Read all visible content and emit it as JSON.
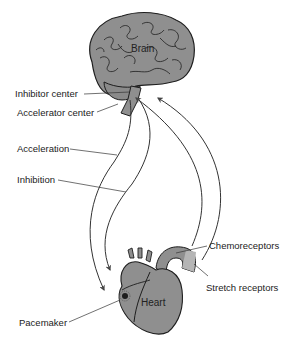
{
  "diagram": {
    "organs": {
      "brain": "Brain",
      "heart": "Heart"
    },
    "labels": {
      "inhibitor_center": "Inhibitor center",
      "accelerator_center": "Accelerator center",
      "acceleration": "Acceleration",
      "inhibition": "Inhibition",
      "chemoreceptors": "Chemoreceptors",
      "stretch_receptors": "Stretch receptors",
      "pacemaker": "Pacemaker"
    },
    "colors": {
      "organ_fill": "#8f8f8f",
      "organ_stroke": "#1e1e1e",
      "nerve_line": "#333333",
      "arrow_head": "#444444",
      "background": "#ffffff"
    }
  }
}
